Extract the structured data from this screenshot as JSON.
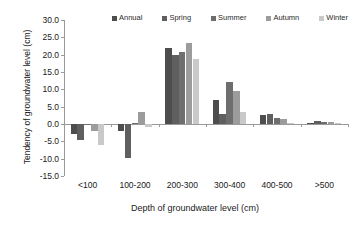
{
  "chart_data": {
    "type": "bar",
    "title": "",
    "xlabel": "Depth of groundwater level (cm)",
    "ylabel": "Tendency of groundwater level (cm)",
    "categories": [
      "<100",
      "100-200",
      "200-300",
      "300-400",
      "400-500",
      ">500"
    ],
    "ylim": [
      -15.0,
      30.0
    ],
    "yticks": [
      -15.0,
      -10.0,
      -5.0,
      0.0,
      5.0,
      10.0,
      15.0,
      20.0,
      25.0,
      30.0
    ],
    "ytick_labels": [
      "-15.0",
      "-10.0",
      "-5.0",
      "0.0",
      "5.0",
      "10.0",
      "15.0",
      "20.0",
      "25.0",
      "30.0"
    ],
    "grid": false,
    "legend_position": "top",
    "series": [
      {
        "name": "Annual",
        "color": "#4d4d4d",
        "values": [
          -3.0,
          -2.0,
          21.8,
          7.0,
          2.5,
          0.4
        ]
      },
      {
        "name": "Spring",
        "color": "#5f5f5f",
        "values": [
          -4.5,
          -9.9,
          20.0,
          3.0,
          3.0,
          0.8
        ]
      },
      {
        "name": "Summer",
        "color": "#6e6e6e",
        "values": [
          0.0,
          0.3,
          20.7,
          12.0,
          1.8,
          0.5
        ]
      },
      {
        "name": "Autumn",
        "color": "#9c9c9c",
        "values": [
          -2.0,
          3.4,
          23.5,
          9.5,
          1.4,
          0.7
        ]
      },
      {
        "name": "Winter",
        "color": "#c9c9c9",
        "values": [
          -6.0,
          -1.0,
          18.8,
          3.5,
          0.3,
          0.2
        ]
      }
    ]
  }
}
